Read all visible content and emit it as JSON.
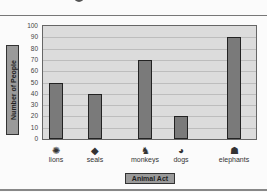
{
  "chart_data": {
    "type": "bar",
    "title": "",
    "xlabel": "Animal Act",
    "ylabel": "Number of People",
    "categories": [
      "lions",
      "seals",
      "monkeys",
      "dogs",
      "elephants"
    ],
    "values": [
      50,
      40,
      70,
      20,
      90
    ],
    "ylim": [
      0,
      100
    ],
    "yticks": [
      0,
      10,
      20,
      30,
      40,
      50,
      60,
      70,
      80,
      90,
      100
    ],
    "grid": true,
    "legend": null,
    "category_icons": [
      "lion-icon",
      "seal-icon",
      "monkey-icon",
      "dog-icon",
      "elephant-icon"
    ],
    "colors": {
      "bar": "#7a7a7a",
      "plot_bg": "#dcdcdc",
      "label_box": "#9a9a9a"
    }
  }
}
